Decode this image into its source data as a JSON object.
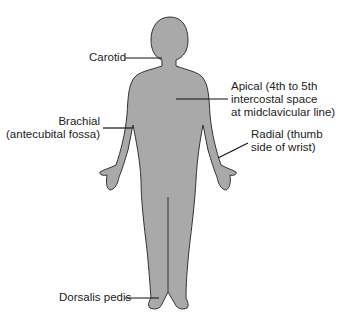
{
  "diagram": {
    "body_fill": "#a9a9a9",
    "outline": "#333333",
    "labels": {
      "carotid": "Carotid",
      "apical_1": "Apical (4th to 5th",
      "apical_2": "intercostal space",
      "apical_3": "at midclavicular line)",
      "brachial_1": "Brachial",
      "brachial_2": "(antecubital fossa)",
      "radial_1": "Radial (thumb",
      "radial_2": "side of wrist)",
      "dorsalis": "Dorsalis pedis"
    }
  }
}
